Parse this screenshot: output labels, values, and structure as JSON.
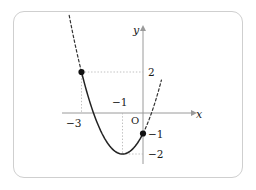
{
  "figure": {
    "frame": {
      "style": "rounded-rectangle-border",
      "color": "#cfcfcf"
    },
    "background_color": "#ffffff"
  },
  "chart_data": {
    "type": "line",
    "title": "",
    "xlabel": "x",
    "ylabel": "y",
    "grid": false,
    "legend": null,
    "xlim": [
      -4.2,
      1.7
    ],
    "ylim": [
      -2.9,
      3.4
    ],
    "curve": {
      "name": "parabola",
      "equation": "y = x^2 + 2x - 1",
      "vertex": {
        "x": -1,
        "y": -2
      },
      "solid_segment_x": [
        -3,
        0
      ],
      "dashed_segments_x": [
        [
          -3.6,
          -3
        ],
        [
          0,
          0.9
        ]
      ],
      "x": [
        -3.6,
        -3.4,
        -3.2,
        -3.0,
        -2.8,
        -2.6,
        -2.4,
        -2.2,
        -2.0,
        -1.8,
        -1.6,
        -1.4,
        -1.2,
        -1.0,
        -0.8,
        -0.6,
        -0.4,
        -0.2,
        0.0,
        0.2,
        0.4,
        0.6,
        0.8,
        0.9
      ],
      "y": [
        3.56,
        2.76,
        2.04,
        2.0,
        0.84,
        0.56,
        -0.44,
        -0.56,
        -1.0,
        -1.36,
        -1.64,
        -1.84,
        -1.96,
        -2.0,
        -1.96,
        -1.84,
        -1.64,
        -1.36,
        -1.0,
        -0.56,
        -0.04,
        0.56,
        1.24,
        1.61
      ]
    },
    "points": [
      {
        "label": "left-point",
        "x": -3,
        "y": 2,
        "marker": "filled-circle"
      },
      {
        "label": "y-intercept-point",
        "x": 0,
        "y": -1,
        "marker": "filled-circle"
      }
    ],
    "guides": [
      {
        "type": "horizontal-dotted",
        "from": {
          "x": -3,
          "y": 2
        },
        "to": {
          "x": 0,
          "y": 2
        }
      },
      {
        "type": "vertical-dotted",
        "from": {
          "x": -3,
          "y": 2
        },
        "to": {
          "x": -3,
          "y": 0
        }
      },
      {
        "type": "vertical-dotted",
        "from": {
          "x": -1,
          "y": 0
        },
        "to": {
          "x": -1,
          "y": -2
        }
      },
      {
        "type": "horizontal-dotted",
        "from": {
          "x": -1,
          "y": -2
        },
        "to": {
          "x": 0,
          "y": -2
        }
      }
    ],
    "annotations": [
      {
        "name": "x-tick-neg3",
        "text": "−3",
        "x": -3,
        "y": 0,
        "position": "below-axis"
      },
      {
        "name": "x-tick-neg1",
        "text": "−1",
        "x": -1,
        "y": 0,
        "position": "above-axis"
      },
      {
        "name": "y-tick-2",
        "text": "2",
        "x": 0,
        "y": 2,
        "position": "right-of-axis"
      },
      {
        "name": "y-tick-neg1",
        "text": "−1",
        "x": 0,
        "y": -1,
        "position": "right-of-axis"
      },
      {
        "name": "y-tick-neg2",
        "text": "−2",
        "x": 0,
        "y": -2,
        "position": "right-of-axis"
      },
      {
        "name": "origin",
        "text": "O",
        "x": 0,
        "y": 0,
        "position": "lower-left-of-origin"
      }
    ],
    "axis_labels": {
      "x_axis_name": "x",
      "y_axis_name": "y"
    }
  }
}
